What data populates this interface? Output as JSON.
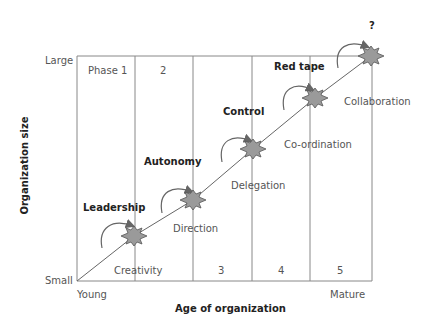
{
  "diagram": {
    "type": "greiner-growth-model",
    "x_axis": {
      "title": "Age of organization",
      "start_label": "Young",
      "end_label": "Mature"
    },
    "y_axis": {
      "title": "Organization size",
      "bottom_label": "Small",
      "top_label": "Large"
    },
    "phases": [
      {
        "label": "Phase 1",
        "evolution": "Creativity",
        "crisis": "Leadership"
      },
      {
        "label": "2",
        "evolution": "Direction",
        "crisis": "Autonomy"
      },
      {
        "label": "3",
        "evolution": "Delegation",
        "crisis": "Control"
      },
      {
        "label": "4",
        "evolution": "Co-ordination",
        "crisis": "Red tape"
      },
      {
        "label": "5",
        "evolution": "Collaboration",
        "crisis": "?"
      }
    ],
    "colors": {
      "line": "#666666",
      "burst_fill": "#9a9a9a",
      "burst_stroke": "#555555",
      "text": "#555555",
      "bold_text": "#222222"
    }
  }
}
